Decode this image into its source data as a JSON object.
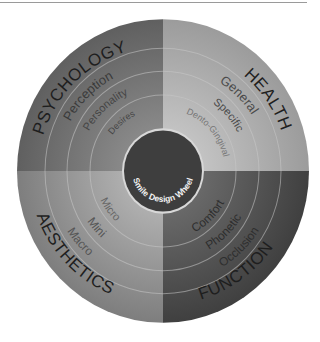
{
  "title": "Smile Design Wheel",
  "quadrants": [
    {
      "name": "PSYCHOLOGY",
      "rings": [
        "Perception",
        "Personality",
        "Desires"
      ],
      "color": "#6e6e6e"
    },
    {
      "name": "HEALTH",
      "rings": [
        "General",
        "Specific",
        "Dento-Gingival"
      ],
      "color": "#a8a8a8"
    },
    {
      "name": "AESTHETICS",
      "rings": [
        "Macro",
        "Mini",
        "Micro"
      ],
      "color": "#8c8c8c"
    },
    {
      "name": "FUNCTION",
      "rings": [
        "Occlusion",
        "Phonetic",
        "Comfort"
      ],
      "color": "#4e4e4e"
    }
  ],
  "center": {
    "label": "Smile Design Wheel",
    "color": "#3e3e3e"
  }
}
